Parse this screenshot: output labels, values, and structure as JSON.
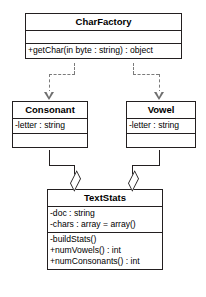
{
  "diagram": {
    "type": "uml-class-diagram",
    "top_cropped_text": "· · · ·",
    "colors": {
      "background": "#ffffff",
      "box_border": "#231f20",
      "text": "#000000",
      "solid_connector": "#231f20",
      "dashed_connector": "#7b7b7b",
      "arrow_head": "#6f6f6f"
    }
  },
  "classes": {
    "charfactory": {
      "name": "CharFactory",
      "attributes": [],
      "operations": [
        "+getChar(in byte : string) : object"
      ]
    },
    "consonant": {
      "name": "Consonant",
      "attributes": [
        "-letter : string"
      ],
      "operations": []
    },
    "vowel": {
      "name": "Vowel",
      "attributes": [
        "-letter : string"
      ],
      "operations": []
    },
    "textstats": {
      "name": "TextStats",
      "attributes": [
        "-doc : string",
        "-chars : array = array()"
      ],
      "operations": [
        "-buildStats()",
        "+numVowels() : int",
        "+numConsonants() : int"
      ]
    }
  },
  "relationships": [
    {
      "id": "charfactory-consonant",
      "kind": "realization",
      "line": "dashed",
      "arrow": "open-triangle",
      "from": "CharFactory",
      "to": "Consonant"
    },
    {
      "id": "charfactory-vowel",
      "kind": "realization",
      "line": "dashed",
      "arrow": "open-triangle",
      "from": "CharFactory",
      "to": "Vowel"
    },
    {
      "id": "consonant-textstats",
      "kind": "aggregation",
      "line": "solid",
      "arrow": "hollow-diamond",
      "from": "Consonant",
      "to": "TextStats"
    },
    {
      "id": "vowel-textstats",
      "kind": "aggregation",
      "line": "solid",
      "arrow": "hollow-diamond",
      "from": "Vowel",
      "to": "TextStats"
    }
  ]
}
